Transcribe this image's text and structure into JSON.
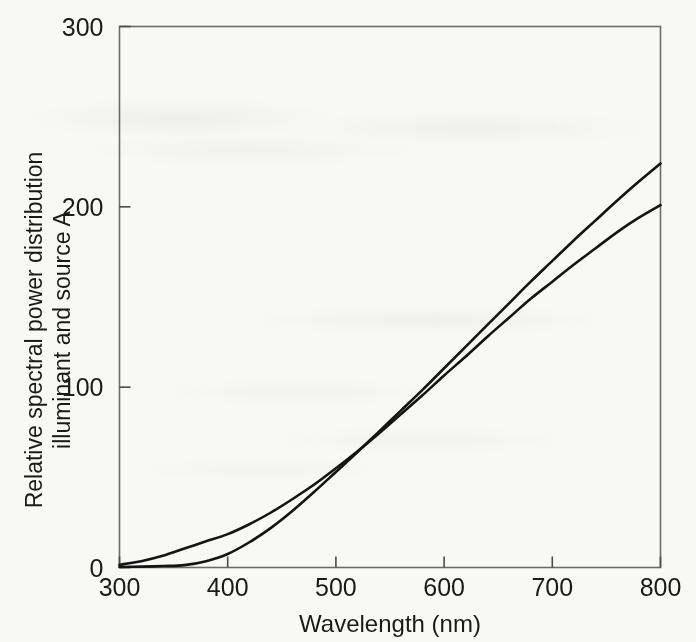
{
  "figure": {
    "background_color": "#f8f8f6",
    "frame_color": "#6b6b6b",
    "curve_color": "#141414"
  },
  "axes": {
    "x_title": "Wavelength (nm)",
    "y_title_line1": "Relative spectral power distribution",
    "y_title_line2": "illuminant and source A",
    "x_ticks": [
      "300",
      "400",
      "500",
      "600",
      "700",
      "800"
    ],
    "y_ticks": [
      "0",
      "100",
      "200",
      "300"
    ]
  },
  "chart_data": {
    "type": "line",
    "title": "",
    "xlabel": "Wavelength (nm)",
    "ylabel": "Relative spectral power distribution illuminant and source A",
    "xlim": [
      300,
      800
    ],
    "ylim": [
      0,
      300
    ],
    "xticks": [
      300,
      400,
      500,
      600,
      700,
      800
    ],
    "yticks": [
      0,
      100,
      200,
      300
    ],
    "grid": false,
    "legend": "none",
    "x": [
      300,
      320,
      340,
      360,
      380,
      400,
      420,
      440,
      460,
      480,
      500,
      520,
      540,
      560,
      580,
      600,
      620,
      640,
      660,
      680,
      700,
      720,
      740,
      760,
      780,
      800
    ],
    "series": [
      {
        "name": "CIE illuminant A",
        "values": [
          1.5,
          3.5,
          6.5,
          10.5,
          14.5,
          18.5,
          24.0,
          30.5,
          38.0,
          46.0,
          55.0,
          64.5,
          74.5,
          85.0,
          95.5,
          106.5,
          117.0,
          128.0,
          138.5,
          149.0,
          158.5,
          168.0,
          177.0,
          186.0,
          194.0,
          201.0
        ]
      },
      {
        "name": "CIE source A",
        "values": [
          0.3,
          0.5,
          0.8,
          1.3,
          3.5,
          7.5,
          14.0,
          22.0,
          31.5,
          42.0,
          53.0,
          64.0,
          75.5,
          87.0,
          98.5,
          110.5,
          122.5,
          134.5,
          146.5,
          158.5,
          170.0,
          181.5,
          192.5,
          203.5,
          214.0,
          224.0
        ]
      }
    ]
  }
}
